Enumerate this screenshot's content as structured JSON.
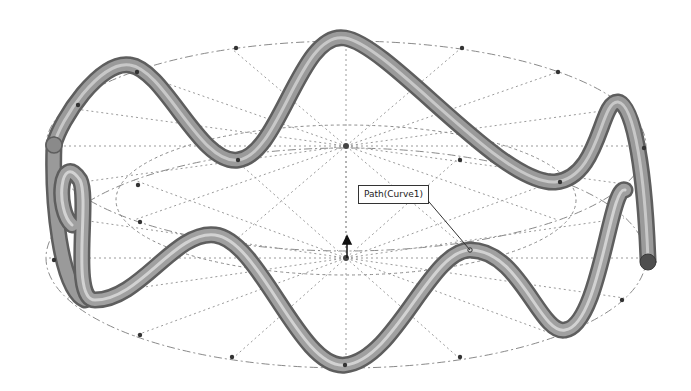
{
  "viewport": {
    "description": "3D CAD graphics area showing a swept tube along a sinusoidal path wrapped around a cylinder",
    "background": "#ffffff",
    "tube_color": "#8a8a8a",
    "tube_highlight": "#d0d0d0",
    "guide_line_color": "#888888",
    "point_color": "#333333"
  },
  "callout": {
    "label": "Path(Curve1)",
    "anchor_point": [
      470,
      250
    ]
  },
  "triad": {
    "icon": "origin-axis-icon"
  }
}
